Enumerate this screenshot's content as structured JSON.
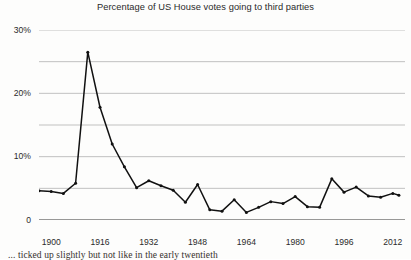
{
  "chart_data": {
    "type": "line",
    "title": "Percentage of US House votes going to third parties",
    "xlabel": "",
    "ylabel": "",
    "xlim": [
      1896,
      2016
    ],
    "ylim": [
      0,
      30
    ],
    "grid": true,
    "legend": null,
    "y_ticks": [
      0,
      5,
      10,
      15,
      20,
      25,
      30
    ],
    "y_tick_labels": [
      "0",
      "",
      "10%",
      "",
      "20%",
      "",
      "30%"
    ],
    "x_ticks": [
      1900,
      1916,
      1932,
      1948,
      1964,
      1980,
      1996,
      2012
    ],
    "x_tick_labels": [
      "1900",
      "1916",
      "1932",
      "1948",
      "1964",
      "1980",
      "1996",
      "2012"
    ],
    "x_minor_tick_step": 4,
    "series": [
      {
        "name": "Third party share of US House vote",
        "color": "#111111",
        "marker": "dot",
        "x": [
          1896,
          1900,
          1904,
          1908,
          1912,
          1916,
          1920,
          1924,
          1928,
          1932,
          1936,
          1940,
          1944,
          1948,
          1952,
          1956,
          1960,
          1964,
          1968,
          1972,
          1976,
          1980,
          1984,
          1988,
          1992,
          1996,
          2000,
          2004,
          2008,
          2012,
          2014
        ],
        "y": [
          4.6,
          4.5,
          4.2,
          5.8,
          26.5,
          17.8,
          12.0,
          8.4,
          5.1,
          6.2,
          5.4,
          4.7,
          2.8,
          5.6,
          1.6,
          1.4,
          3.2,
          1.2,
          2.0,
          2.9,
          2.6,
          3.7,
          2.1,
          2.0,
          6.5,
          4.4,
          5.2,
          3.8,
          3.6,
          4.2,
          3.9
        ]
      }
    ],
    "annotations": []
  },
  "chart": {
    "title": "Percentage of US House votes going to third parties",
    "y_labels": [
      {
        "text": "30%",
        "value": 30
      },
      {
        "text": "20%",
        "value": 20
      },
      {
        "text": "10%",
        "value": 10
      },
      {
        "text": "0",
        "value": 0
      }
    ],
    "x_labels": [
      {
        "text": "1900",
        "value": 1900
      },
      {
        "text": "1916",
        "value": 1916
      },
      {
        "text": "1932",
        "value": 1932
      },
      {
        "text": "1948",
        "value": 1948
      },
      {
        "text": "1964",
        "value": 1964
      },
      {
        "text": "1980",
        "value": 1980
      },
      {
        "text": "1996",
        "value": 1996
      },
      {
        "text": "2012",
        "value": 2012
      }
    ],
    "colors": {
      "line": "#111111",
      "gridline": "#a8a8a8",
      "axis": "#333333",
      "text": "#2b2b2b",
      "background": "#fdfdfc"
    }
  },
  "page": {
    "body_text_fragment": "... ticked up slightly but not like in the early twentieth"
  }
}
